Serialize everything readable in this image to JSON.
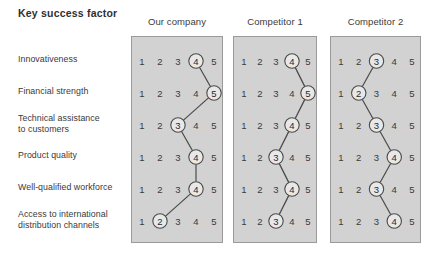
{
  "title": "Key success factor",
  "columns": [
    {
      "label": "Our company"
    },
    {
      "label": "Competitor 1"
    },
    {
      "label": "Competitor 2"
    }
  ],
  "scale": {
    "min": 1,
    "max": 5,
    "ticks": [
      "1",
      "2",
      "3",
      "4",
      "5"
    ]
  },
  "rows": [
    {
      "label_line1": "Innovativeness",
      "label_line2": ""
    },
    {
      "label_line1": "Financial strength",
      "label_line2": ""
    },
    {
      "label_line1": "Technical assistance",
      "label_line2": "to customers"
    },
    {
      "label_line1": "Product quality",
      "label_line2": ""
    },
    {
      "label_line1": "Well-qualified workforce",
      "label_line2": ""
    },
    {
      "label_line1": "Access to international",
      "label_line2": "distribution channels"
    }
  ],
  "colors": {
    "panel_fill": "#d2d2d2",
    "panel_border": "#9a9a9a",
    "line": "#4a4a4a",
    "circle_fill": "#e8e8e8",
    "text": "#3a3a3a"
  },
  "chart_data": {
    "type": "line",
    "title": "Key success factor",
    "xlabel": "",
    "ylabel": "",
    "xlim": [
      1,
      5
    ],
    "grid": false,
    "legend_position": "top",
    "categories": [
      "Innovativeness",
      "Financial strength",
      "Technical assistance to customers",
      "Product quality",
      "Well-qualified workforce",
      "Access to international distribution channels"
    ],
    "series": [
      {
        "name": "Our company",
        "values": [
          4,
          5,
          3,
          4,
          4,
          2
        ]
      },
      {
        "name": "Competitor 1",
        "values": [
          4,
          5,
          4,
          3,
          4,
          3
        ]
      },
      {
        "name": "Competitor 2",
        "values": [
          3,
          2,
          3,
          4,
          3,
          4
        ]
      }
    ]
  }
}
